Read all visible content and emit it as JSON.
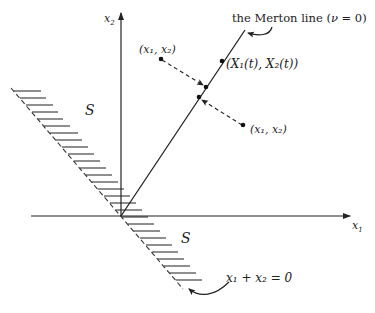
{
  "diagram": {
    "type": "geometric-phase-diagram",
    "colors": {
      "ink": "#222222",
      "background": "#ffffff"
    },
    "axes": {
      "x_label": "x",
      "x_sub": "1",
      "y_label": "x",
      "y_sub": "2"
    },
    "merton_line": {
      "label_prefix": "the Merton line (",
      "label_nu": "ν",
      "label_suffix": " = 0)"
    },
    "points": {
      "upper_left": {
        "label": "(x₁, x₂)"
      },
      "on_line": {
        "label": "(X₁(t), X₂(t))"
      },
      "lower_right": {
        "label": "(x₁, x₂)"
      }
    },
    "regions": {
      "upper": {
        "label": "S"
      },
      "lower": {
        "label": "S"
      }
    },
    "boundary": {
      "label": "x₁ + x₂ = 0"
    }
  }
}
